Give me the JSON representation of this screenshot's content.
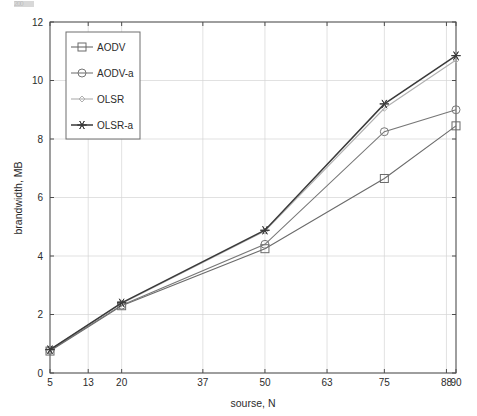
{
  "figure": {
    "background_color": "#ffffff",
    "axis_color": "#4d4d4d",
    "grid_color": "#d4d4d4",
    "text_color": "#2b2b2b",
    "artifact_text": "200"
  },
  "chart_data": {
    "type": "line",
    "title": "",
    "xlabel": "sourse, N",
    "ylabel": "brandwidth, MB",
    "x": [
      5,
      20,
      50,
      75,
      90
    ],
    "xlim": [
      5,
      90
    ],
    "ylim": [
      0,
      12
    ],
    "x_tick_labels": [
      "5",
      "13",
      "20",
      "37",
      "50",
      "63",
      "75",
      "88",
      "90"
    ],
    "x_tick_values": [
      5,
      13,
      20,
      37,
      50,
      63,
      75,
      88,
      90
    ],
    "y_tick_labels": [
      "0",
      "2",
      "4",
      "6",
      "8",
      "10",
      "12"
    ],
    "y_tick_values": [
      0,
      2,
      4,
      6,
      8,
      10,
      12
    ],
    "grid": true,
    "legend_position": "upper-left",
    "series": [
      {
        "name": "AODV",
        "marker": "square",
        "color": "#6b6b6b",
        "values": [
          0.75,
          2.3,
          4.25,
          6.65,
          8.45
        ]
      },
      {
        "name": "AODV-a",
        "marker": "circle",
        "color": "#777777",
        "values": [
          0.78,
          2.32,
          4.4,
          8.25,
          9.0
        ]
      },
      {
        "name": "OLSR",
        "marker": "diamond",
        "color": "#b0b0b0",
        "values": [
          0.8,
          2.38,
          4.85,
          9.05,
          10.7
        ]
      },
      {
        "name": "OLSR-a",
        "marker": "star",
        "color": "#3a3a3a",
        "values": [
          0.8,
          2.4,
          4.88,
          9.2,
          10.85
        ]
      }
    ]
  },
  "legend": {
    "items": [
      {
        "label": "AODV"
      },
      {
        "label": "AODV-a"
      },
      {
        "label": "OLSR"
      },
      {
        "label": "OLSR-a"
      }
    ]
  }
}
